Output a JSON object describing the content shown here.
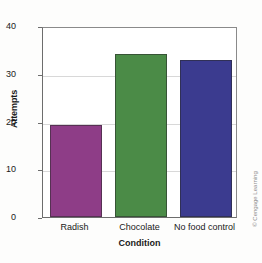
{
  "chart_data": {
    "type": "bar",
    "title": "",
    "subtitle": "",
    "categories": [
      "Radish",
      "Chocolate",
      "No food control"
    ],
    "values": [
      19.3,
      34.1,
      32.8
    ],
    "series": [
      {
        "name": "Attempts",
        "values": [
          19.3,
          34.1,
          32.8
        ]
      }
    ],
    "xlabel": "Condition",
    "ylabel": "Attempts",
    "ylim": [
      0,
      40
    ],
    "yticks": [
      0,
      10,
      20,
      30,
      40
    ],
    "ytick_labels": [
      "0",
      "10",
      "20",
      "30",
      "40"
    ],
    "grid": true,
    "grid_axis": "y",
    "legend": false,
    "legend_position": "none",
    "bar_colors": [
      "#8e3d87",
      "#4b8b47",
      "#3b3b8f"
    ],
    "annotations": []
  },
  "credit": {
    "text": "© Cengage Learning"
  },
  "axis": {
    "y_title": "Attempts",
    "x_title": "Condition"
  }
}
